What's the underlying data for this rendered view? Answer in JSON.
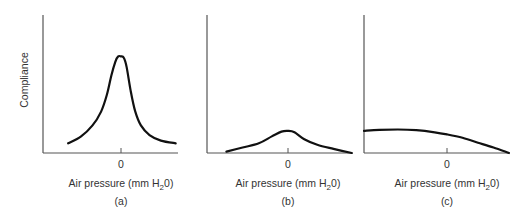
{
  "chart_data": [
    {
      "id": "a",
      "type": "line",
      "panel_label": "(a)",
      "xlabel_main": "Air pressure (mm H",
      "xlabel_sub": "2",
      "xlabel_end": "0)",
      "ylabel": "Compliance",
      "x_tick_labels": [
        "0"
      ],
      "x_ticks": [
        0
      ],
      "xlim": [
        -1.37,
        1.0
      ],
      "ylim": [
        0,
        1
      ],
      "grid": false,
      "series": [
        {
          "name": "Type A tympanogram",
          "x": [
            -0.93,
            -0.7,
            -0.5,
            -0.35,
            -0.25,
            -0.17,
            -0.1,
            -0.05,
            0.0,
            0.05,
            0.1,
            0.17,
            0.25,
            0.35,
            0.5,
            0.7,
            0.96
          ],
          "y": [
            0.07,
            0.12,
            0.2,
            0.3,
            0.42,
            0.56,
            0.66,
            0.7,
            0.7,
            0.69,
            0.62,
            0.45,
            0.3,
            0.2,
            0.13,
            0.09,
            0.07
          ]
        }
      ]
    },
    {
      "id": "b",
      "type": "line",
      "panel_label": "(b)",
      "xlabel_main": "Air pressure (mm H",
      "xlabel_sub": "2",
      "xlabel_end": "0)",
      "ylabel": "",
      "x_tick_labels": [
        "0"
      ],
      "x_ticks": [
        0
      ],
      "xlim": [
        -1.25,
        1.0
      ],
      "ylim": [
        0,
        1
      ],
      "grid": false,
      "series": [
        {
          "name": "Type B tympanogram",
          "x": [
            -0.95,
            -0.7,
            -0.45,
            -0.25,
            -0.1,
            0.0,
            0.1,
            0.25,
            0.45,
            0.7,
            0.98
          ],
          "y": [
            0.01,
            0.04,
            0.07,
            0.12,
            0.155,
            0.16,
            0.15,
            0.1,
            0.06,
            0.03,
            0.0
          ]
        }
      ]
    },
    {
      "id": "c",
      "type": "line",
      "panel_label": "(c)",
      "xlabel_main": "Air pressure (mm H",
      "xlabel_sub": "2",
      "xlabel_end": "0)",
      "ylabel": "",
      "x_tick_labels": [
        "0"
      ],
      "x_ticks": [
        0
      ],
      "xlim": [
        -1.35,
        1.0
      ],
      "ylim": [
        0,
        1
      ],
      "grid": false,
      "series": [
        {
          "name": "Type C tympanogram",
          "x": [
            -1.35,
            -1.1,
            -0.8,
            -0.5,
            -0.2,
            0.0,
            0.25,
            0.5,
            0.75,
            1.0
          ],
          "y": [
            0.16,
            0.168,
            0.17,
            0.165,
            0.15,
            0.135,
            0.11,
            0.075,
            0.04,
            0.0
          ]
        }
      ]
    }
  ]
}
